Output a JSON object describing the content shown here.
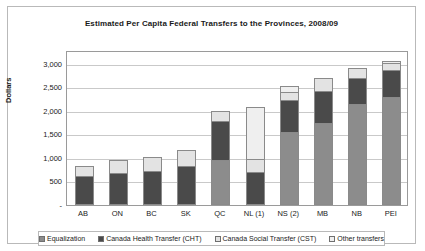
{
  "chart_data": {
    "type": "bar",
    "stacked": true,
    "title": "Estimated Per Capita Federal Transfers to the Provinces, 2008/09",
    "xlabel": "",
    "ylabel": "Dollars",
    "ylim": [
      0,
      3250
    ],
    "ytick_labels": [
      "-",
      "500",
      "1,000",
      "1,500",
      "2,000",
      "2,500",
      "3,000"
    ],
    "ytick_values": [
      0,
      500,
      1000,
      1500,
      2000,
      2500,
      3000
    ],
    "grid": true,
    "legend_position": "bottom",
    "categories": [
      "AB",
      "ON",
      "BC",
      "SK",
      "QC",
      "NL (1)",
      "NS (2)",
      "MB",
      "NB",
      "PEI"
    ],
    "series": [
      {
        "name": "Equalization",
        "color": "#8c8c8c",
        "values": [
          0,
          0,
          0,
          0,
          950,
          0,
          1550,
          1750,
          2150,
          2300
        ]
      },
      {
        "name": "Canada Health Transfer (CHT)",
        "color": "#4a4a4a",
        "values": [
          610,
          680,
          730,
          830,
          850,
          700,
          700,
          700,
          560,
          600
        ]
      },
      {
        "name": "Canada Social Transfer (CST)",
        "color": "#e3e3e3",
        "values": [
          240,
          300,
          320,
          350,
          250,
          290,
          200,
          300,
          240,
          150
        ]
      },
      {
        "name": "Other transfers",
        "color": "#efefef",
        "values": [
          0,
          0,
          0,
          0,
          0,
          1130,
          150,
          0,
          0,
          80
        ]
      }
    ]
  },
  "legend": {
    "items": [
      {
        "label": "Equalization"
      },
      {
        "label": "Canada Health Transfer (CHT)"
      },
      {
        "label": "Canada Social Transfer (CST)"
      },
      {
        "label": "Other transfers"
      }
    ]
  }
}
